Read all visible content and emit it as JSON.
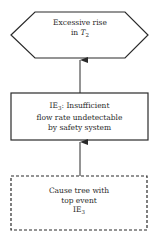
{
  "diagram": {
    "type": "fault-tree-fragment",
    "colors": {
      "line": "#2a2a2a",
      "background": "#ffffff"
    },
    "nodes": [
      {
        "id": "top",
        "shape": "hexagon",
        "line1": "Excessive rise",
        "line2_prefix": "in ",
        "line2_var": "T",
        "line2_sub": "2"
      },
      {
        "id": "ie3",
        "shape": "rectangle",
        "line1_prefix": "IE",
        "line1_sub": "3",
        "line1_rest": ": Insufficient",
        "line2": "flow rate undetectable",
        "line3": "by safety system"
      },
      {
        "id": "cause-tree",
        "shape": "dashed-rectangle",
        "line1": "Cause tree with",
        "line2": "top event",
        "line3_prefix": "IE",
        "line3_sub": "3"
      }
    ],
    "edges": [
      {
        "from": "ie3",
        "to": "top",
        "arrow": "up"
      },
      {
        "from": "cause-tree",
        "to": "ie3",
        "arrow": "up"
      }
    ]
  }
}
